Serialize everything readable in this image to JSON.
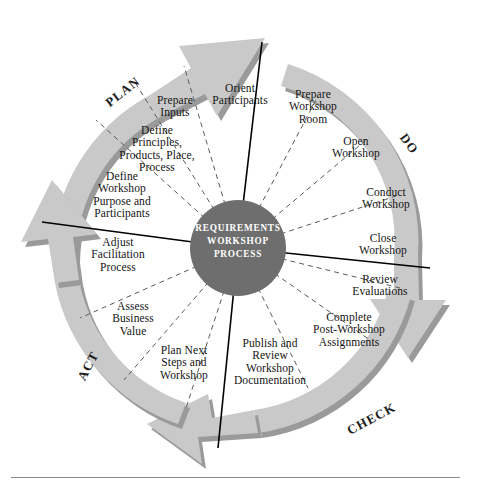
{
  "diagram": {
    "title_hub": "REQUIREMENTS\nWORKSHOP\nPROCESS",
    "colors": {
      "ring_fill": "#c9c9c9",
      "ring_shadow": "#9a9a9a",
      "hub_fill": "#6e6e6e",
      "hub_text": "#ffffff",
      "divider_line": "#000000",
      "dashed_line": "#5a5a5a",
      "rule": "#8d8d8d",
      "background": "#ffffff"
    },
    "phases": [
      {
        "id": "plan",
        "label": "PLAN",
        "x": 103,
        "y": 84,
        "rotate": -38
      },
      {
        "id": "do",
        "label": "DO",
        "x": 398,
        "y": 136,
        "rotate": 54
      },
      {
        "id": "check",
        "label": "CHECK",
        "x": 345,
        "y": 411,
        "rotate": -28
      },
      {
        "id": "act",
        "label": "ACT",
        "x": 73,
        "y": 358,
        "rotate": -62
      }
    ],
    "steps": [
      {
        "id": "orient-participants",
        "phase": "plan",
        "label": "Orient\nParticipants",
        "x": 197,
        "y": 82,
        "w": 86
      },
      {
        "id": "prepare-inputs",
        "phase": "plan",
        "label": "Prepare\nInputs",
        "x": 145,
        "y": 94,
        "w": 60
      },
      {
        "id": "define-principles",
        "phase": "plan",
        "label": "Define\nPrinciples,\nProducts, Place,\nProcess",
        "x": 103,
        "y": 124,
        "w": 108
      },
      {
        "id": "define-purpose",
        "phase": "plan",
        "label": "Define\nWorkshop\nPurpose and\nParticipants",
        "x": 70,
        "y": 170,
        "w": 104
      },
      {
        "id": "prepare-room",
        "phase": "do",
        "label": "Prepare\nWorkshop\nRoom",
        "x": 270,
        "y": 88,
        "w": 86
      },
      {
        "id": "open-workshop",
        "phase": "do",
        "label": "Open\nWorkshop",
        "x": 315,
        "y": 135,
        "w": 82
      },
      {
        "id": "conduct-workshop",
        "phase": "do",
        "label": "Conduct\nWorkshop",
        "x": 345,
        "y": 186,
        "w": 82
      },
      {
        "id": "close-workshop",
        "phase": "do",
        "label": "Close\nWorkshop",
        "x": 342,
        "y": 232,
        "w": 82
      },
      {
        "id": "review-evaluations",
        "phase": "check",
        "label": "Review\nEvaluations",
        "x": 334,
        "y": 273,
        "w": 92
      },
      {
        "id": "complete-assignments",
        "phase": "check",
        "label": "Complete\nPost-Workshop\nAssignments",
        "x": 295,
        "y": 311,
        "w": 108
      },
      {
        "id": "publish-review-doc",
        "phase": "check",
        "label": "Publish and\nReview\nWorkshop\nDocumentation",
        "x": 222,
        "y": 337,
        "w": 96
      },
      {
        "id": "plan-next-steps",
        "phase": "act",
        "label": "Plan Next\nSteps and\nWorkshop",
        "x": 144,
        "y": 344,
        "w": 80
      },
      {
        "id": "assess-business-value",
        "phase": "act",
        "label": "Assess\nBusiness\nValue",
        "x": 97,
        "y": 300,
        "w": 72
      },
      {
        "id": "adjust-facilitation",
        "phase": "act",
        "label": "Adjust\nFacilitation\nProcess",
        "x": 76,
        "y": 236,
        "w": 84
      }
    ]
  }
}
